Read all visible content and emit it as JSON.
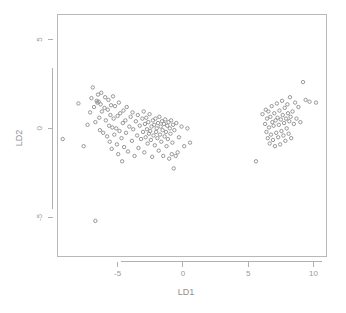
{
  "figure": {
    "background_color": "#ffffff",
    "frame_color": "#b8b8b8",
    "point_color": "#8c8c8c",
    "tick_label_color": "#9a9a9a",
    "axis_title_color": "#8f8f8f"
  },
  "chart_data": {
    "type": "scatter",
    "title": "",
    "subtitle": "",
    "xlabel": "LD1",
    "ylabel": "LD2",
    "xlim": [
      -9.6,
      11.0
    ],
    "ylim": [
      -7.2,
      6.4
    ],
    "xticks": [
      -5,
      0,
      5,
      10
    ],
    "xtick_labels": [
      "-5",
      "0",
      "5",
      "10"
    ],
    "yticks": [
      5,
      0,
      -5
    ],
    "ytick_labels": [
      "5",
      "0",
      "-5"
    ],
    "grid": false,
    "legend": null,
    "marker": "open-circle",
    "marker_size": 1.7,
    "series": [
      {
        "name": "projected samples",
        "color": "#8c8c8c",
        "points": [
          [
            -9.2,
            -0.6
          ],
          [
            -8.0,
            1.4
          ],
          [
            -7.6,
            -1.0
          ],
          [
            -7.3,
            0.2
          ],
          [
            -7.1,
            0.9
          ],
          [
            -7.0,
            1.7
          ],
          [
            -6.9,
            2.3
          ],
          [
            -6.8,
            1.2
          ],
          [
            -6.7,
            0.35
          ],
          [
            -6.6,
            1.55
          ],
          [
            -6.55,
            1.45
          ],
          [
            -6.5,
            1.9
          ],
          [
            -6.45,
            1.5
          ],
          [
            -6.4,
            0.6
          ],
          [
            -6.35,
            -0.1
          ],
          [
            -6.3,
            1.35
          ],
          [
            -6.25,
            2.0
          ],
          [
            -6.2,
            0.95
          ],
          [
            -6.1,
            -0.25
          ],
          [
            -6.0,
            1.15
          ],
          [
            -5.95,
            1.75
          ],
          [
            -5.9,
            0.45
          ],
          [
            -5.8,
            -0.45
          ],
          [
            -5.75,
            1.05
          ],
          [
            -5.7,
            1.6
          ],
          [
            -5.65,
            0.15
          ],
          [
            -5.6,
            -0.75
          ],
          [
            -5.55,
            0.75
          ],
          [
            -5.5,
            1.3
          ],
          [
            -5.45,
            -1.15
          ],
          [
            -5.4,
            0.05
          ],
          [
            -5.35,
            1.8
          ],
          [
            -5.3,
            0.55
          ],
          [
            -5.25,
            -0.35
          ],
          [
            -5.2,
            1.25
          ],
          [
            -5.1,
            0.0
          ],
          [
            -5.05,
            -0.9
          ],
          [
            -5.0,
            0.7
          ],
          [
            -4.95,
            -1.45
          ],
          [
            -4.9,
            1.45
          ],
          [
            -4.85,
            -0.15
          ],
          [
            -4.8,
            0.85
          ],
          [
            -4.7,
            -0.55
          ],
          [
            -4.65,
            -1.85
          ],
          [
            -4.6,
            0.3
          ],
          [
            -4.55,
            1.0
          ],
          [
            -4.5,
            -1.05
          ],
          [
            -4.4,
            0.45
          ],
          [
            -4.35,
            -0.25
          ],
          [
            -4.3,
            1.2
          ],
          [
            -4.2,
            -1.3
          ],
          [
            -4.1,
            0.1
          ],
          [
            -4.0,
            0.65
          ],
          [
            -3.9,
            -0.7
          ],
          [
            -3.85,
            0.9
          ],
          [
            -3.8,
            -0.05
          ],
          [
            -3.7,
            -1.55
          ],
          [
            -3.6,
            0.4
          ],
          [
            -3.5,
            -0.4
          ],
          [
            -3.45,
            0.75
          ],
          [
            -3.4,
            -1.1
          ],
          [
            -3.3,
            0.15
          ],
          [
            -3.2,
            -0.6
          ],
          [
            -3.1,
            0.55
          ],
          [
            -3.05,
            -0.2
          ],
          [
            -3.0,
            0.95
          ],
          [
            -2.95,
            -1.35
          ],
          [
            -2.9,
            0.25
          ],
          [
            -2.85,
            -0.5
          ],
          [
            -2.8,
            0.6
          ],
          [
            -2.75,
            -0.05
          ],
          [
            -2.7,
            -0.85
          ],
          [
            -2.65,
            0.35
          ],
          [
            -2.6,
            -0.3
          ],
          [
            -2.55,
            0.8
          ],
          [
            -2.5,
            -0.15
          ],
          [
            -2.45,
            -0.65
          ],
          [
            -2.4,
            0.1
          ],
          [
            -2.35,
            -1.6
          ],
          [
            -2.3,
            0.45
          ],
          [
            -2.25,
            -0.4
          ],
          [
            -2.2,
            0.2
          ],
          [
            -2.15,
            -0.95
          ],
          [
            -2.1,
            0.55
          ],
          [
            -2.05,
            -0.2
          ],
          [
            -2.0,
            0.0
          ],
          [
            -1.95,
            -0.55
          ],
          [
            -1.9,
            0.3
          ],
          [
            -1.85,
            -1.25
          ],
          [
            -1.8,
            0.65
          ],
          [
            -1.75,
            -0.35
          ],
          [
            -1.7,
            0.1
          ],
          [
            -1.65,
            -0.75
          ],
          [
            -1.6,
            0.4
          ],
          [
            -1.55,
            -0.1
          ],
          [
            -1.5,
            -1.55
          ],
          [
            -1.45,
            0.25
          ],
          [
            -1.4,
            -0.45
          ],
          [
            -1.35,
            0.5
          ],
          [
            -1.3,
            -0.2
          ],
          [
            -1.25,
            -1.0
          ],
          [
            -1.2,
            0.15
          ],
          [
            -1.15,
            -0.6
          ],
          [
            -1.1,
            0.35
          ],
          [
            -1.05,
            -1.7
          ],
          [
            -1.0,
            0.0
          ],
          [
            -0.95,
            -0.3
          ],
          [
            -0.9,
            0.45
          ],
          [
            -0.85,
            -1.45
          ],
          [
            -0.8,
            -0.8
          ],
          [
            -0.75,
            0.2
          ],
          [
            -0.7,
            -2.25
          ],
          [
            -0.65,
            -0.1
          ],
          [
            -0.55,
            -1.55
          ],
          [
            -0.5,
            0.3
          ],
          [
            -0.4,
            -1.35
          ],
          [
            -0.3,
            -0.5
          ],
          [
            -0.1,
            0.1
          ],
          [
            0.1,
            -1.0
          ],
          [
            0.35,
            0.0
          ],
          [
            0.55,
            -0.8
          ],
          [
            5.6,
            -1.85
          ],
          [
            6.1,
            0.8
          ],
          [
            6.3,
            0.25
          ],
          [
            6.35,
            1.05
          ],
          [
            6.4,
            -0.2
          ],
          [
            6.45,
            0.55
          ],
          [
            6.5,
            -0.55
          ],
          [
            6.55,
            0.95
          ],
          [
            6.6,
            0.05
          ],
          [
            6.65,
            -0.85
          ],
          [
            6.7,
            0.65
          ],
          [
            6.75,
            -0.35
          ],
          [
            6.8,
            1.25
          ],
          [
            6.85,
            0.35
          ],
          [
            6.9,
            -0.65
          ],
          [
            6.95,
            0.15
          ],
          [
            7.0,
            0.85
          ],
          [
            7.05,
            -1.0
          ],
          [
            7.1,
            0.45
          ],
          [
            7.15,
            -0.25
          ],
          [
            7.2,
            1.4
          ],
          [
            7.25,
            0.6
          ],
          [
            7.3,
            -0.5
          ],
          [
            7.35,
            0.2
          ],
          [
            7.4,
            1.0
          ],
          [
            7.45,
            -0.9
          ],
          [
            7.5,
            0.5
          ],
          [
            7.55,
            -0.15
          ],
          [
            7.6,
            1.55
          ],
          [
            7.65,
            0.75
          ],
          [
            7.7,
            -0.4
          ],
          [
            7.75,
            0.3
          ],
          [
            7.8,
            1.15
          ],
          [
            7.85,
            -0.7
          ],
          [
            7.9,
            0.55
          ],
          [
            7.95,
            0.0
          ],
          [
            8.0,
            1.35
          ],
          [
            8.05,
            0.85
          ],
          [
            8.1,
            -0.3
          ],
          [
            8.15,
            0.4
          ],
          [
            8.2,
            1.75
          ],
          [
            8.25,
            0.65
          ],
          [
            8.3,
            -0.55
          ],
          [
            8.4,
            0.95
          ],
          [
            8.5,
            0.25
          ],
          [
            8.6,
            1.45
          ],
          [
            8.7,
            0.55
          ],
          [
            8.85,
            1.2
          ],
          [
            9.0,
            0.35
          ],
          [
            9.2,
            2.6
          ],
          [
            9.4,
            1.6
          ],
          [
            9.7,
            1.5
          ],
          [
            10.2,
            1.45
          ],
          [
            -6.7,
            -5.2
          ]
        ]
      }
    ]
  },
  "axes": {
    "x_title": "LD1",
    "y_title": "LD2"
  }
}
